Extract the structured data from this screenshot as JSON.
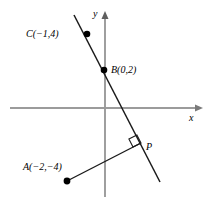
{
  "figure": {
    "name": "coordinate-geometry-diagram",
    "background_color": "#ffffff",
    "width": 217,
    "height": 202
  },
  "axes": {
    "x_label": "x",
    "y_label": "y",
    "axis_color": "#808080",
    "origin_px": [
      105,
      108
    ],
    "x_axis_px": [
      [
        10,
        108
      ],
      [
        203,
        108
      ]
    ],
    "y_axis_px": [
      [
        105,
        197
      ],
      [
        105,
        13
      ]
    ]
  },
  "points": [
    {
      "id": "C",
      "label": "C(−1,4)",
      "coords": [
        -1,
        4
      ],
      "px": [
        87,
        34
      ],
      "label_px": [
        26,
        29
      ],
      "marker": "filled-dot"
    },
    {
      "id": "B",
      "label": "B(0,2)",
      "coords": [
        0,
        2
      ],
      "px": [
        104,
        70
      ],
      "label_px": [
        111,
        65
      ],
      "marker": "filled-dot"
    },
    {
      "id": "A",
      "label": "A(−2,−4)",
      "coords": [
        -2,
        -4
      ],
      "px": [
        67,
        181
      ],
      "label_px": [
        23,
        162
      ],
      "marker": "filled-dot"
    },
    {
      "id": "P",
      "label": "P",
      "coords": null,
      "px": [
        141,
        143
      ],
      "label_px": [
        146,
        142
      ],
      "marker": "none"
    }
  ],
  "lines": [
    {
      "id": "line-BC",
      "description": "steep line through C(-1,4) and B(0,2)",
      "color": "#1a1a1a",
      "from_px": [
        74,
        15
      ],
      "to_px": [
        160,
        182
      ]
    },
    {
      "id": "segment-AP",
      "description": "perpendicular segment from A(-2,-4) to foot P on line BC",
      "color": "#1a1a1a",
      "from_px": [
        67,
        181
      ],
      "to_px": [
        141,
        143
      ]
    }
  ],
  "markers": {
    "right_angle": {
      "name": "right-angle-marker",
      "description": "square marker at P showing AP is perpendicular to line BC",
      "px": [
        131,
        140
      ],
      "size": 9,
      "color": "#1a1a1a"
    }
  }
}
